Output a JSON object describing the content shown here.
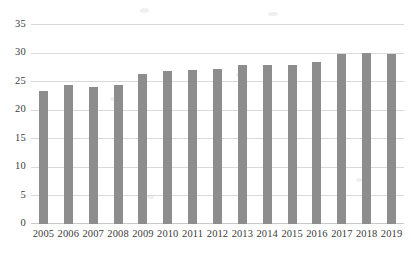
{
  "chart_data": {
    "type": "bar",
    "title": "",
    "subtitle": "",
    "xlabel": "",
    "ylabel": "",
    "categories": [
      "2005",
      "2006",
      "2007",
      "2008",
      "2009",
      "2010",
      "2011",
      "2012",
      "2013",
      "2014",
      "2015",
      "2016",
      "2017",
      "2018",
      "2019"
    ],
    "values": [
      23.2,
      24.4,
      23.9,
      24.4,
      26.3,
      26.7,
      27.0,
      27.2,
      27.8,
      27.9,
      27.8,
      28.4,
      29.8,
      30.0,
      29.7
    ],
    "series": [
      {
        "name": "",
        "values": [
          23.2,
          24.4,
          23.9,
          24.4,
          26.3,
          26.7,
          27.0,
          27.2,
          27.8,
          27.9,
          27.8,
          28.4,
          29.8,
          30.0,
          29.7
        ]
      }
    ],
    "ylim": [
      0,
      35
    ],
    "yticks": [
      0,
      5,
      10,
      15,
      20,
      25,
      30,
      35
    ],
    "ytick_labels": [
      "0",
      "5",
      "10",
      "15",
      "20",
      "25",
      "30",
      "35"
    ],
    "xtick_labels": [
      "2005",
      "2006",
      "2007",
      "2008",
      "2009",
      "2010",
      "2011",
      "2012",
      "2013",
      "2014",
      "2015",
      "2016",
      "2017",
      "2018",
      "2019"
    ],
    "grid": true,
    "grid_axis": "y",
    "legend": false,
    "legend_position": "none",
    "annotations": [],
    "colors": {
      "bar": "#8d8d8d",
      "gridline": "#d9d9d9",
      "baseline": "#c9c9c9",
      "text": "#3c3c3c",
      "background": "#ffffff"
    }
  }
}
